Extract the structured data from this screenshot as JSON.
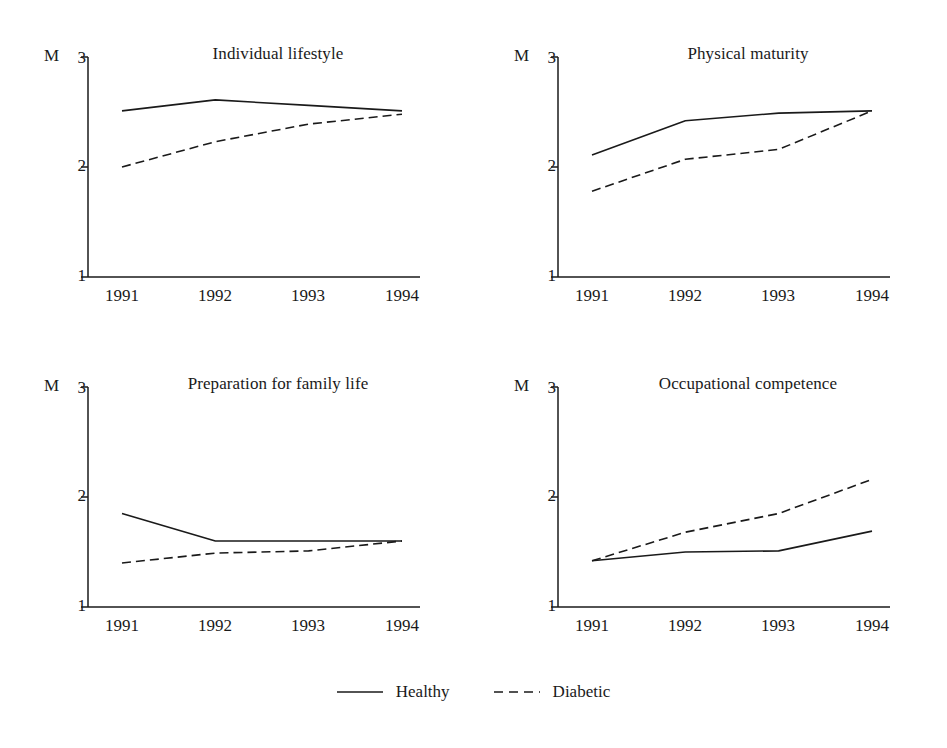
{
  "figure": {
    "y_axis_caption": "M",
    "legend": {
      "position": "bottom-center",
      "entries": [
        {
          "label": "Healthy",
          "style": "solid",
          "icon": "solid-line-icon"
        },
        {
          "label": "Diabetic",
          "style": "dashed",
          "icon": "dashed-line-icon"
        }
      ]
    }
  },
  "chart_data": [
    {
      "type": "line",
      "title": "Individual lifestyle",
      "xlabel": "",
      "ylabel": "M",
      "x": [
        "1991",
        "1992",
        "1993",
        "1994"
      ],
      "categories": [
        "1991",
        "1992",
        "1993",
        "1994"
      ],
      "ylim": [
        1,
        3
      ],
      "yticks": [
        1,
        2,
        3
      ],
      "ytick_labels": [
        "1",
        "2",
        "3"
      ],
      "grid": false,
      "series": [
        {
          "name": "Healthy",
          "style": "solid",
          "values": [
            2.51,
            2.61,
            2.56,
            2.51
          ]
        },
        {
          "name": "Diabetic",
          "style": "dashed",
          "values": [
            2.0,
            2.23,
            2.39,
            2.48
          ]
        }
      ]
    },
    {
      "type": "line",
      "title": "Physical maturity",
      "xlabel": "",
      "ylabel": "M",
      "x": [
        "1991",
        "1992",
        "1993",
        "1994"
      ],
      "categories": [
        "1991",
        "1992",
        "1993",
        "1994"
      ],
      "ylim": [
        1,
        3
      ],
      "yticks": [
        1,
        2,
        3
      ],
      "ytick_labels": [
        "1",
        "2",
        "3"
      ],
      "grid": false,
      "series": [
        {
          "name": "Healthy",
          "style": "solid",
          "values": [
            2.11,
            2.42,
            2.49,
            2.51
          ]
        },
        {
          "name": "Diabetic",
          "style": "dashed",
          "values": [
            1.78,
            2.07,
            2.16,
            2.51
          ]
        }
      ]
    },
    {
      "type": "line",
      "title": "Preparation for family life",
      "xlabel": "",
      "ylabel": "M",
      "x": [
        "1991",
        "1992",
        "1993",
        "1994"
      ],
      "categories": [
        "1991",
        "1992",
        "1993",
        "1994"
      ],
      "ylim": [
        1,
        3
      ],
      "yticks": [
        1,
        2,
        3
      ],
      "ytick_labels": [
        "1",
        "2",
        "3"
      ],
      "grid": false,
      "series": [
        {
          "name": "Healthy",
          "style": "solid",
          "values": [
            1.85,
            1.6,
            1.6,
            1.6
          ]
        },
        {
          "name": "Diabetic",
          "style": "dashed",
          "values": [
            1.4,
            1.49,
            1.51,
            1.6
          ]
        }
      ]
    },
    {
      "type": "line",
      "title": "Occupational competence",
      "xlabel": "",
      "ylabel": "M",
      "x": [
        "1991",
        "1992",
        "1993",
        "1994"
      ],
      "categories": [
        "1991",
        "1992",
        "1993",
        "1994"
      ],
      "ylim": [
        1,
        3
      ],
      "yticks": [
        1,
        2,
        3
      ],
      "ytick_labels": [
        "1",
        "2",
        "3"
      ],
      "grid": false,
      "series": [
        {
          "name": "Healthy",
          "style": "solid",
          "values": [
            1.42,
            1.5,
            1.51,
            1.69
          ]
        },
        {
          "name": "Diabetic",
          "style": "dashed",
          "values": [
            1.42,
            1.68,
            1.85,
            2.16
          ]
        }
      ]
    }
  ],
  "colors": {
    "ink": "#1a1a1a",
    "background": "#ffffff"
  }
}
